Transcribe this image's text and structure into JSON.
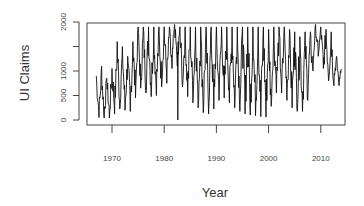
{
  "chart_data": {
    "type": "line",
    "title": "",
    "xlabel": "Year",
    "ylabel": "UI Claims",
    "xlim": [
      1965,
      2014.5
    ],
    "ylim": [
      0,
      2000
    ],
    "x_ticks": [
      1970,
      1980,
      1990,
      2000,
      2010
    ],
    "x_tick_labels": [
      "1970",
      "1980",
      "1990",
      "2000",
      "2010"
    ],
    "y_ticks": [
      0,
      500,
      1000,
      1500,
      2000
    ],
    "y_tick_labels": [
      "0",
      "500",
      "1000",
      "",
      "2000"
    ],
    "grid": false,
    "legend": null,
    "series_description": "Seasonal series; annual peak and trough envelope read from plot",
    "series": [
      {
        "name": "UI Claims",
        "x": [
          1967,
          1968,
          1969,
          1970,
          1971,
          1972,
          1973,
          1974,
          1975,
          1976,
          1977,
          1978,
          1979,
          1980,
          1981,
          1982,
          1983,
          1984,
          1985,
          1986,
          1987,
          1988,
          1989,
          1990,
          1991,
          1992,
          1993,
          1994,
          1995,
          1996,
          1997,
          1998,
          1999,
          2000,
          2001,
          2002,
          2003,
          2004,
          2005,
          2006,
          2007,
          2008,
          2009,
          2010,
          2011,
          2012,
          2013
        ],
        "annual_peak": [
          900,
          1100,
          850,
          1050,
          1600,
          1500,
          1300,
          1600,
          1900,
          1900,
          1900,
          1900,
          1900,
          1900,
          1900,
          1950,
          1900,
          1900,
          1900,
          1900,
          1900,
          1900,
          1900,
          1900,
          1900,
          1900,
          1900,
          1900,
          1900,
          1900,
          1900,
          1900,
          1900,
          1850,
          1900,
          1900,
          1900,
          1850,
          1800,
          1700,
          1800,
          1800,
          1950,
          1900,
          1850,
          1800,
          1300
        ],
        "annual_trough": [
          50,
          50,
          30,
          50,
          200,
          250,
          150,
          200,
          700,
          600,
          500,
          450,
          550,
          800,
          700,
          1400,
          800,
          550,
          400,
          300,
          200,
          100,
          150,
          300,
          500,
          400,
          300,
          200,
          150,
          100,
          100,
          80,
          60,
          60,
          500,
          600,
          500,
          300,
          200,
          150,
          200,
          600,
          1400,
          1200,
          900,
          700,
          700
        ]
      }
    ],
    "annotations": [
      {
        "x": 1982.6,
        "y": 0,
        "note": "single sharp drop to ~0"
      }
    ]
  },
  "axes": {
    "xlabel": "Year",
    "ylabel": "UI Claims"
  }
}
